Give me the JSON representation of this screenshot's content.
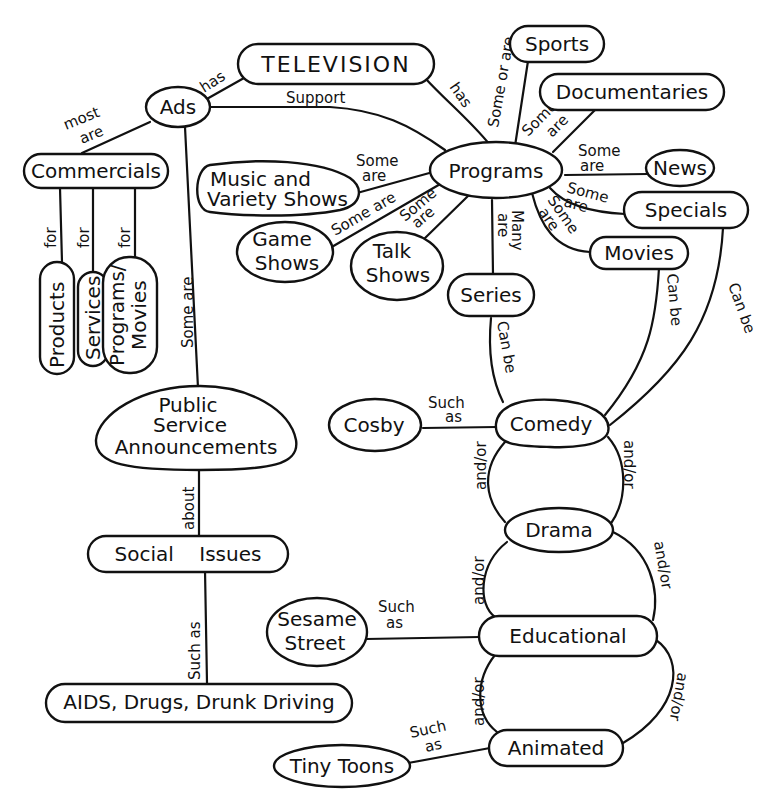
{
  "nodes": {
    "television": "TELEVISION",
    "ads": "Ads",
    "commercials": "Commercials",
    "products": "Products",
    "services": "Services",
    "programs_movies_1": "Programs/",
    "programs_movies_2": "Movies",
    "psa_1": "Public",
    "psa_2": "Service",
    "psa_3": "Announcements",
    "social_issues": "Social    Issues",
    "aids": "AIDS, Drugs, Drunk Driving",
    "programs": "Programs",
    "sports": "Sports",
    "documentaries": "Documentaries",
    "news": "News",
    "specials": "Specials",
    "movies": "Movies",
    "series": "Series",
    "music_1": "Music and",
    "music_2": "Variety Shows",
    "game_1": "Game",
    "game_2": "Shows",
    "talk_1": "Talk",
    "talk_2": "Shows",
    "comedy": "Comedy",
    "cosby": "Cosby",
    "drama": "Drama",
    "educational": "Educational",
    "sesame_1": "Sesame",
    "sesame_2": "Street",
    "animated": "Animated",
    "tiny_toons": "Tiny Toons"
  },
  "links": {
    "has": "has",
    "support": "Support",
    "most": "most",
    "are": "are",
    "for": "for",
    "some_are": "Some are",
    "some": "Some",
    "about": "about",
    "such_as": "Such as",
    "such": "Such",
    "as": "as",
    "some_or_are": "Some or are",
    "many": "Many",
    "can_be": "Can be",
    "and_or": "and/or"
  }
}
